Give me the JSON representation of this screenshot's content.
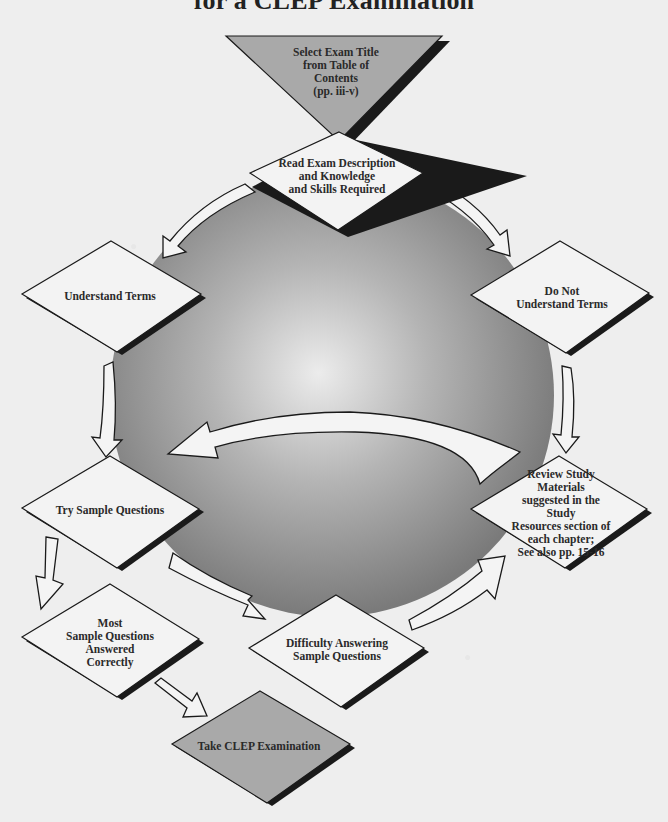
{
  "diagram": {
    "title": "for a CLEP Examination",
    "colors": {
      "background": "#eeeeee",
      "sphere_center": "#eaeaea",
      "sphere_edge": "#7c7c7c",
      "node_fill": "#f3f3f3",
      "terminal_fill": "#a8a8a8",
      "stroke": "#1a1a1a",
      "arrow_fill": "#f4f4f4"
    },
    "nodes": [
      {
        "id": "select",
        "shape": "inverted-triangle",
        "label": "Select Exam Title\nfrom Table of\nContents\n(pp. iii-v)"
      },
      {
        "id": "read",
        "shape": "diamond",
        "label": "Read Exam Description\nand Knowledge\nand Skills Required"
      },
      {
        "id": "understand",
        "shape": "diamond",
        "label": "Understand Terms"
      },
      {
        "id": "not_understand",
        "shape": "diamond",
        "label": "Do Not\nUnderstand Terms"
      },
      {
        "id": "try",
        "shape": "diamond",
        "label": "Try Sample Questions"
      },
      {
        "id": "review",
        "shape": "diamond",
        "label": "Review Study Materials\nsuggested in the Study\nResources section of\neach chapter;\nSee also pp. 15-16"
      },
      {
        "id": "most",
        "shape": "diamond",
        "label": "Most\nSample Questions\nAnswered\nCorrectly"
      },
      {
        "id": "difficulty",
        "shape": "diamond",
        "label": "Difficulty Answering\nSample Questions"
      },
      {
        "id": "take",
        "shape": "diamond",
        "label": "Take CLEP Examination"
      }
    ],
    "edges": [
      {
        "from": "select",
        "to": "read"
      },
      {
        "from": "read",
        "to": "understand"
      },
      {
        "from": "read",
        "to": "not_understand"
      },
      {
        "from": "understand",
        "to": "try"
      },
      {
        "from": "not_understand",
        "to": "review"
      },
      {
        "from": "review",
        "to": "try"
      },
      {
        "from": "try",
        "to": "most"
      },
      {
        "from": "try",
        "to": "difficulty"
      },
      {
        "from": "difficulty",
        "to": "review"
      },
      {
        "from": "most",
        "to": "take"
      }
    ]
  }
}
